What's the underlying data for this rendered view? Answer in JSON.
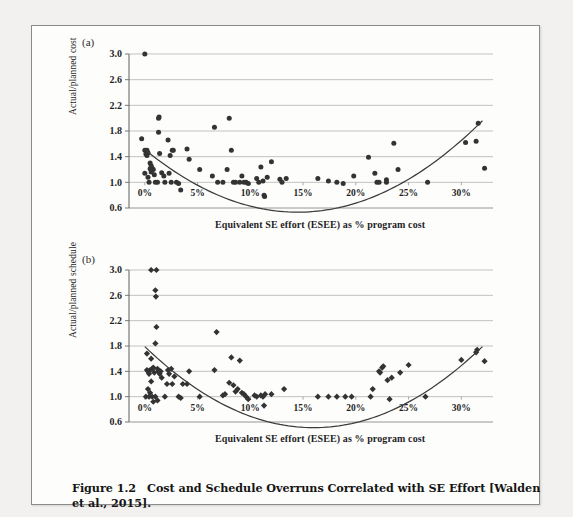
{
  "figure": {
    "caption_number": "Figure 1.2",
    "caption_text": "Cost and Schedule Overruns Correlated with SE Effort [Walden et al., 2015]."
  },
  "panels": [
    {
      "tag": "(a)"
    },
    {
      "tag": "(b)"
    }
  ],
  "chart_data": [
    {
      "type": "scatter",
      "panel": "(a)",
      "title": "",
      "xlabel": "Equivalent SE effort (ESEE) as % program cost",
      "ylabel": "Actual/planned cost",
      "xlim": [
        -1.5,
        33
      ],
      "ylim": [
        0.6,
        3.0
      ],
      "xticks": [
        0,
        5,
        10,
        15,
        20,
        25,
        30
      ],
      "xtick_labels": [
        "0%",
        "5%",
        "10%",
        "15%",
        "20%",
        "25%",
        "30%"
      ],
      "yticks": [
        0.6,
        1.0,
        1.4,
        1.8,
        2.2,
        2.6,
        3.0
      ],
      "ytick_labels": [
        "0.6",
        "1.0",
        "1.4",
        "1.8",
        "2.2",
        "2.6",
        "3.0"
      ],
      "grid": true,
      "marker": "circle",
      "marker_color": "#333333",
      "points": [
        [
          0.0,
          3.0
        ],
        [
          -0.3,
          1.68
        ],
        [
          0.0,
          1.5
        ],
        [
          0.2,
          1.5
        ],
        [
          0.3,
          1.46
        ],
        [
          0.1,
          1.44
        ],
        [
          0.2,
          1.42
        ],
        [
          0.0,
          1.14
        ],
        [
          0.3,
          1.08
        ],
        [
          0.5,
          1.3
        ],
        [
          0.6,
          1.26
        ],
        [
          0.7,
          1.22
        ],
        [
          0.5,
          1.21
        ],
        [
          0.8,
          1.2
        ],
        [
          0.6,
          1.16
        ],
        [
          0.9,
          1.12
        ],
        [
          0.4,
          1.0
        ],
        [
          1.0,
          1.0
        ],
        [
          1.2,
          1.0
        ],
        [
          1.3,
          2.0
        ],
        [
          1.35,
          2.02
        ],
        [
          1.3,
          1.78
        ],
        [
          1.4,
          1.45
        ],
        [
          1.6,
          1.15
        ],
        [
          1.8,
          1.1
        ],
        [
          1.9,
          1.0
        ],
        [
          2.2,
          1.66
        ],
        [
          2.4,
          1.42
        ],
        [
          2.6,
          1.5
        ],
        [
          2.7,
          1.5
        ],
        [
          2.3,
          1.14
        ],
        [
          2.5,
          1.0
        ],
        [
          3.0,
          1.0
        ],
        [
          3.2,
          0.98
        ],
        [
          3.4,
          0.88
        ],
        [
          4.0,
          1.52
        ],
        [
          4.2,
          1.36
        ],
        [
          5.2,
          1.2
        ],
        [
          6.4,
          1.1
        ],
        [
          6.6,
          1.86
        ],
        [
          6.9,
          1.0
        ],
        [
          7.4,
          1.0
        ],
        [
          7.8,
          1.2
        ],
        [
          8.0,
          2.0
        ],
        [
          8.2,
          1.5
        ],
        [
          8.4,
          1.0
        ],
        [
          8.6,
          1.0
        ],
        [
          9.0,
          1.0
        ],
        [
          9.2,
          1.1
        ],
        [
          9.4,
          1.0
        ],
        [
          9.6,
          1.0
        ],
        [
          9.8,
          0.98
        ],
        [
          10.6,
          1.06
        ],
        [
          10.8,
          1.0
        ],
        [
          11.0,
          1.24
        ],
        [
          11.2,
          1.02
        ],
        [
          11.3,
          0.8
        ],
        [
          11.35,
          0.78
        ],
        [
          11.6,
          1.08
        ],
        [
          12.0,
          1.32
        ],
        [
          12.8,
          1.05
        ],
        [
          13.0,
          1.0
        ],
        [
          13.4,
          1.06
        ],
        [
          16.4,
          1.06
        ],
        [
          17.4,
          1.02
        ],
        [
          18.2,
          1.0
        ],
        [
          18.8,
          0.98
        ],
        [
          19.8,
          1.1
        ],
        [
          21.2,
          1.39
        ],
        [
          21.8,
          1.14
        ],
        [
          22.0,
          1.0
        ],
        [
          22.2,
          1.0
        ],
        [
          22.9,
          1.0
        ],
        [
          22.9,
          1.04
        ],
        [
          23.6,
          1.61
        ],
        [
          24.0,
          1.2
        ],
        [
          26.8,
          1.0
        ],
        [
          30.4,
          1.62
        ],
        [
          31.4,
          1.64
        ],
        [
          31.6,
          1.92
        ],
        [
          32.2,
          1.22
        ]
      ],
      "trend": {
        "type": "quadratic",
        "a": 0.00465,
        "b": -0.1348,
        "c": 1.512
      }
    },
    {
      "type": "scatter",
      "panel": "(b)",
      "title": "",
      "xlabel": "Equivalent SE effort (ESEE) as % program cost",
      "ylabel": "Actual/planned schedule",
      "xlim": [
        -1.5,
        33
      ],
      "ylim": [
        0.6,
        3.0
      ],
      "xticks": [
        0,
        5,
        10,
        15,
        20,
        25,
        30
      ],
      "xtick_labels": [
        "0%",
        "5%",
        "10%",
        "15%",
        "20%",
        "25%",
        "30%"
      ],
      "yticks": [
        0.6,
        1.0,
        1.4,
        1.8,
        2.2,
        2.6,
        3.0
      ],
      "ytick_labels": [
        "0.6",
        "1.0",
        "1.4",
        "1.8",
        "2.2",
        "2.6",
        "3.0"
      ],
      "grid": true,
      "marker": "diamond",
      "marker_color": "#333333",
      "points": [
        [
          0.6,
          3.0
        ],
        [
          1.1,
          3.0
        ],
        [
          1.0,
          2.68
        ],
        [
          1.05,
          2.58
        ],
        [
          1.1,
          2.1
        ],
        [
          1.0,
          1.84
        ],
        [
          0.2,
          1.68
        ],
        [
          0.6,
          1.6
        ],
        [
          0.2,
          1.42
        ],
        [
          0.3,
          1.4
        ],
        [
          0.5,
          1.42
        ],
        [
          0.7,
          1.44
        ],
        [
          0.8,
          1.46
        ],
        [
          0.4,
          1.36
        ],
        [
          0.9,
          1.38
        ],
        [
          1.2,
          1.44
        ],
        [
          1.3,
          1.4
        ],
        [
          1.4,
          1.36
        ],
        [
          1.5,
          1.4
        ],
        [
          1.6,
          1.3
        ],
        [
          0.6,
          1.24
        ],
        [
          0.3,
          1.12
        ],
        [
          0.5,
          1.06
        ],
        [
          0.1,
          1.0
        ],
        [
          0.4,
          1.0
        ],
        [
          0.7,
          1.0
        ],
        [
          0.8,
          0.92
        ],
        [
          1.2,
          0.94
        ],
        [
          1.0,
          1.0
        ],
        [
          1.9,
          1.0
        ],
        [
          2.2,
          1.42
        ],
        [
          2.3,
          1.36
        ],
        [
          2.5,
          1.44
        ],
        [
          2.8,
          1.32
        ],
        [
          2.1,
          1.2
        ],
        [
          2.6,
          1.2
        ],
        [
          3.2,
          1.0
        ],
        [
          3.4,
          0.98
        ],
        [
          3.6,
          1.2
        ],
        [
          4.2,
          1.4
        ],
        [
          4.0,
          1.2
        ],
        [
          5.2,
          1.0
        ],
        [
          6.8,
          2.02
        ],
        [
          6.6,
          1.42
        ],
        [
          7.4,
          1.02
        ],
        [
          7.6,
          1.04
        ],
        [
          8.0,
          1.22
        ],
        [
          8.2,
          1.62
        ],
        [
          8.4,
          1.18
        ],
        [
          8.6,
          1.08
        ],
        [
          8.8,
          1.12
        ],
        [
          9.0,
          1.57
        ],
        [
          9.2,
          1.06
        ],
        [
          9.4,
          1.04
        ],
        [
          9.6,
          1.0
        ],
        [
          9.8,
          0.96
        ],
        [
          10.4,
          1.02
        ],
        [
          10.6,
          1.0
        ],
        [
          11.0,
          1.02
        ],
        [
          11.2,
          1.0
        ],
        [
          11.4,
          1.04
        ],
        [
          11.3,
          0.86
        ],
        [
          12.0,
          1.04
        ],
        [
          13.2,
          1.12
        ],
        [
          16.4,
          1.0
        ],
        [
          17.4,
          1.0
        ],
        [
          18.2,
          1.0
        ],
        [
          19.0,
          1.0
        ],
        [
          19.6,
          1.0
        ],
        [
          21.4,
          1.0
        ],
        [
          21.6,
          1.12
        ],
        [
          22.2,
          1.4
        ],
        [
          22.3,
          1.38
        ],
        [
          22.5,
          1.46
        ],
        [
          22.6,
          1.48
        ],
        [
          23.0,
          1.26
        ],
        [
          23.4,
          1.3
        ],
        [
          23.2,
          0.96
        ],
        [
          25.0,
          1.5
        ],
        [
          24.2,
          1.38
        ],
        [
          26.6,
          1.0
        ],
        [
          30.0,
          1.58
        ],
        [
          31.4,
          1.7
        ],
        [
          31.5,
          1.74
        ],
        [
          32.2,
          1.56
        ]
      ],
      "trend": {
        "type": "quadratic",
        "a": 0.005,
        "b": -0.16,
        "c": 1.79
      }
    }
  ]
}
